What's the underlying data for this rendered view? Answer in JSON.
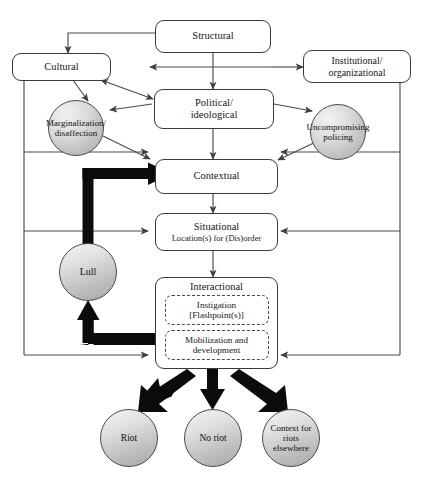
{
  "diagram": {
    "type": "flowchart",
    "background_color": "#ffffff",
    "line_color": "#4a4a4a",
    "emphasis_line_color": "#000000",
    "box_fill": "#ffffff",
    "circle_fill_light": "#f2f2f2",
    "circle_fill_dark": "#a9a9a9"
  },
  "nodes": {
    "structural": {
      "label": "Structural",
      "shape": "rounded-rect"
    },
    "cultural": {
      "label": "Cultural",
      "shape": "rounded-rect"
    },
    "institutional": {
      "label": "Institutional/\norganizational",
      "shape": "rounded-rect"
    },
    "political": {
      "label": "Political/\nideological",
      "shape": "rounded-rect"
    },
    "contextual": {
      "label": "Contextual",
      "shape": "rounded-rect"
    },
    "situational": {
      "label": "Situational",
      "sublabel": "Location(s) for (Dis)order",
      "shape": "rounded-rect"
    },
    "interactional": {
      "label": "Interactional",
      "shape": "rounded-rect",
      "sub_boxes": [
        {
          "label": "Instigation\n[Flashpoint(s)]"
        },
        {
          "label": "Mobilization and\ndevelopment"
        }
      ]
    },
    "marginalization": {
      "label": "Marginalization/\ndisaffection",
      "shape": "circle"
    },
    "uncompromising": {
      "label": "Uncompromising\npolicing",
      "shape": "circle"
    },
    "lull": {
      "label": "Lull",
      "shape": "circle"
    },
    "riot": {
      "label": "Riot",
      "shape": "circle"
    },
    "no_riot": {
      "label": "No riot",
      "shape": "circle"
    },
    "context_elsewhere": {
      "label": "Context for riots\nelsewhere",
      "shape": "circle"
    }
  },
  "edges": [
    {
      "from": "structural",
      "to": "cultural",
      "style": "thin-arrow"
    },
    {
      "from": "structural",
      "to": "institutional",
      "style": "thin-arrow"
    },
    {
      "from": "structural",
      "to": "political",
      "style": "thin-arrow"
    },
    {
      "from": "structural",
      "to": "cultural",
      "style": "thin-arrow-left"
    },
    {
      "from": "cultural",
      "to": "political",
      "style": "thin-arrow-double"
    },
    {
      "from": "cultural",
      "to": "marginalization",
      "style": "thin-arrow"
    },
    {
      "from": "political",
      "to": "marginalization",
      "style": "thin-arrow"
    },
    {
      "from": "political",
      "to": "uncompromising",
      "style": "thin-arrow"
    },
    {
      "from": "political",
      "to": "contextual",
      "style": "thin-arrow"
    },
    {
      "from": "marginalization",
      "to": "contextual",
      "style": "thin-arrow"
    },
    {
      "from": "uncompromising",
      "to": "contextual",
      "style": "thin-arrow"
    },
    {
      "from": "contextual",
      "to": "situational",
      "style": "thin-arrow"
    },
    {
      "from": "situational",
      "to": "interactional",
      "style": "thin-arrow"
    },
    {
      "from": "cultural",
      "to": "contextual",
      "style": "feedback-left"
    },
    {
      "from": "cultural",
      "to": "situational",
      "style": "feedback-left"
    },
    {
      "from": "cultural",
      "to": "interactional",
      "style": "feedback-left"
    },
    {
      "from": "institutional",
      "to": "contextual",
      "style": "feedback-right"
    },
    {
      "from": "institutional",
      "to": "situational",
      "style": "feedback-right"
    },
    {
      "from": "institutional",
      "to": "interactional",
      "style": "feedback-right"
    },
    {
      "from": "interactional",
      "to": "lull",
      "style": "thick-arrow"
    },
    {
      "from": "lull",
      "to": "contextual",
      "style": "thick-arrow"
    },
    {
      "from": "interactional",
      "to": "riot",
      "style": "thick-arrow"
    },
    {
      "from": "interactional",
      "to": "no_riot",
      "style": "thick-arrow"
    },
    {
      "from": "interactional",
      "to": "context_elsewhere",
      "style": "thick-arrow"
    }
  ]
}
